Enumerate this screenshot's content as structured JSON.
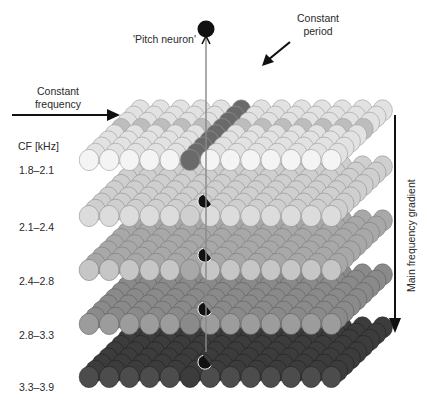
{
  "labels": {
    "pitch_neuron": "'Pitch neuron'",
    "constant_period_line1": "Constant",
    "constant_period_line2": "period",
    "constant_frequency_line1": "Constant",
    "constant_frequency_line2": "frequency",
    "cf_header": "CF [kHz]",
    "main_gradient": "Main frequency gradient"
  },
  "layers": [
    {
      "range": "1.8–2.1",
      "fill": "#f4f4f4",
      "back_fill": "#e2e2e2",
      "stroke": "#9a9a9a"
    },
    {
      "range": "2.1–2.4",
      "fill": "#dcdcdc",
      "back_fill": "#cfcfcf",
      "stroke": "#8e8e8e"
    },
    {
      "range": "2.4–2.8",
      "fill": "#c6c6c6",
      "back_fill": "#a8a8a8",
      "stroke": "#7a7a7a"
    },
    {
      "range": "2.8–3.3",
      "fill": "#9c9c9c",
      "back_fill": "#8a8a8a",
      "stroke": "#5e5e5e"
    },
    {
      "range": "3.3–3.9",
      "fill": "#4c4c4c",
      "back_fill": "#3c3c3c",
      "stroke": "#222222"
    }
  ],
  "colors": {
    "period_column": "#6a6a6a",
    "frequency_row": "#bdbdbd",
    "neuron": "#111111",
    "axon": "#888888",
    "arrow": "#111111"
  }
}
